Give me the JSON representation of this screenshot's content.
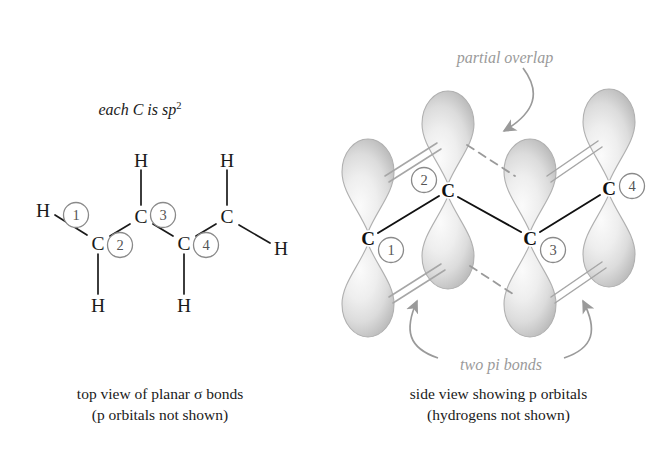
{
  "figure": {
    "title_left_note": "each C is sp",
    "title_left_sup": "2"
  },
  "left_panel": {
    "name": "top view of planar sigma bonds diagram",
    "caption_line1": "top view of planar σ bonds",
    "caption_line2": "(p orbitals not shown)",
    "atoms": [
      {
        "id": "C1",
        "label": "C",
        "x": 98,
        "y": 243,
        "number": "1",
        "nx": 76,
        "ny": 215
      },
      {
        "id": "C2",
        "label": "C",
        "x": 141,
        "y": 216,
        "number": "2",
        "nx": 120,
        "ny": 245
      },
      {
        "id": "C3",
        "label": "C",
        "x": 184,
        "y": 243,
        "number": "3",
        "nx": 163,
        "ny": 215
      },
      {
        "id": "C4",
        "label": "C",
        "x": 227,
        "y": 216,
        "number": "4",
        "nx": 206,
        "ny": 245
      }
    ],
    "hydrogens": [
      {
        "label": "H",
        "x": 43,
        "y": 210
      },
      {
        "label": "H",
        "x": 98,
        "y": 305
      },
      {
        "label": "H",
        "x": 141,
        "y": 160
      },
      {
        "label": "H",
        "x": 184,
        "y": 305
      },
      {
        "label": "H",
        "x": 227,
        "y": 160
      },
      {
        "label": "H",
        "x": 281,
        "y": 248
      }
    ]
  },
  "right_panel": {
    "name": "side view showing p orbitals diagram",
    "caption_line1": "side view showing p orbitals",
    "caption_line2": "(hydrogens not shown)",
    "annotations": {
      "partial_overlap": "partial overlap",
      "two_pi_bonds": "two pi bonds"
    },
    "atoms": [
      {
        "id": "C1",
        "label": "C",
        "x": 368,
        "y": 238,
        "number": "1",
        "nx": 391,
        "ny": 250
      },
      {
        "id": "C2",
        "label": "C",
        "x": 448,
        "y": 190,
        "number": "2",
        "nx": 424,
        "ny": 180
      },
      {
        "id": "C3",
        "label": "C",
        "x": 530,
        "y": 238,
        "number": "3",
        "nx": 553,
        "ny": 250
      },
      {
        "id": "C4",
        "label": "C",
        "x": 609,
        "y": 188,
        "number": "4",
        "nx": 632,
        "ny": 186
      }
    ]
  },
  "colors": {
    "ink": "#1a1a1a",
    "circle_gray": "#8a8a8a",
    "annotation_gray": "#9a9a9a",
    "orbital_light": "#f2f2f2",
    "orbital_mid": "#d8d8d8",
    "orbital_dark": "#b4b4b4",
    "pi_bond_gray": "#a6a6a6"
  }
}
